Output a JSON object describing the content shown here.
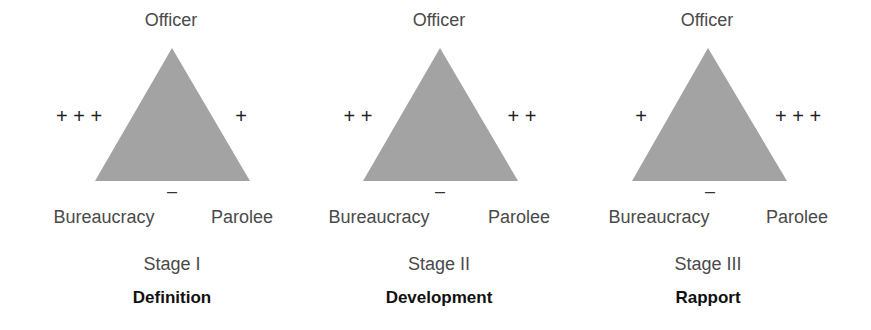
{
  "fill_color": "#a3a3a3",
  "panels": [
    {
      "top_label": "Officer",
      "left_label": "Bureaucracy",
      "right_label": "Parolee",
      "left_sign": "+ + +",
      "right_sign": "+",
      "bottom_sign": "–",
      "stage": "Stage I",
      "name": "Definition"
    },
    {
      "top_label": "Officer",
      "left_label": "Bureaucracy",
      "right_label": "Parolee",
      "left_sign": "+ +",
      "right_sign": "+ +",
      "bottom_sign": "–",
      "stage": "Stage II",
      "name": "Development"
    },
    {
      "top_label": "Officer",
      "left_label": "Bureaucracy",
      "right_label": "Parolee",
      "left_sign": "+",
      "right_sign": "+ + +",
      "bottom_sign": "–",
      "stage": "Stage III",
      "name": "Rapport"
    }
  ]
}
